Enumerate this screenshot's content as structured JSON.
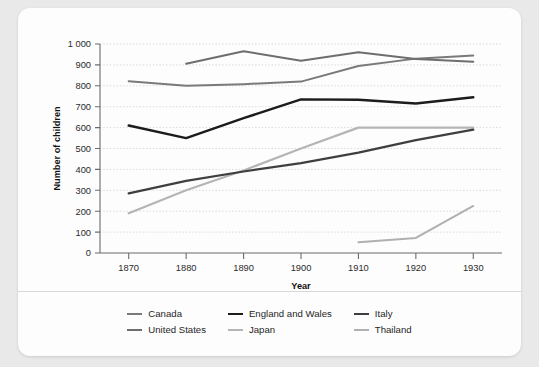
{
  "chart_data": {
    "type": "line",
    "title": "",
    "xlabel": "Year",
    "ylabel": "Number of children",
    "x": [
      1870,
      1880,
      1890,
      1900,
      1910,
      1920,
      1930
    ],
    "xlim": [
      1865,
      1935
    ],
    "ylim": [
      0,
      1000
    ],
    "ytick_labels": [
      "0",
      "100",
      "200",
      "300",
      "400",
      "500",
      "600",
      "700",
      "800",
      "900",
      "1 000"
    ],
    "ytick_values": [
      0,
      100,
      200,
      300,
      400,
      500,
      600,
      700,
      800,
      900,
      1000
    ],
    "xtick_labels": [
      "1870",
      "1880",
      "1890",
      "1900",
      "1910",
      "1920",
      "1930"
    ],
    "grid": "horizontal-dotted",
    "legend_position": "bottom",
    "series": [
      {
        "name": "Canada",
        "color": "#7a7a7a",
        "width": 2.0,
        "x": [
          1870,
          1880,
          1890,
          1900,
          1910,
          1920,
          1930
        ],
        "values": [
          822,
          800,
          808,
          820,
          895,
          930,
          945
        ]
      },
      {
        "name": "United States",
        "color": "#6e6e6e",
        "width": 2.0,
        "x": [
          1880,
          1890,
          1900,
          1910,
          1920,
          1930
        ],
        "values": [
          905,
          965,
          920,
          960,
          928,
          915
        ]
      },
      {
        "name": "England and Wales",
        "color": "#1c1c1c",
        "width": 2.4,
        "x": [
          1870,
          1880,
          1890,
          1900,
          1910,
          1920,
          1930
        ],
        "values": [
          610,
          550,
          645,
          735,
          733,
          715,
          745
        ]
      },
      {
        "name": "Japan",
        "color": "#b5b5b5",
        "width": 2.2,
        "x": [
          1870,
          1880,
          1890,
          1900,
          1910,
          1920,
          1930
        ],
        "values": [
          190,
          300,
          395,
          500,
          600,
          600,
          600
        ]
      },
      {
        "name": "Italy",
        "color": "#3f3f3f",
        "width": 2.2,
        "x": [
          1870,
          1880,
          1890,
          1900,
          1910,
          1920,
          1930
        ],
        "values": [
          285,
          345,
          390,
          430,
          480,
          540,
          590
        ]
      },
      {
        "name": "Thailand",
        "color": "#b0b0b0",
        "width": 2.0,
        "x": [
          1910,
          1920,
          1930
        ],
        "values": [
          52,
          72,
          225
        ]
      }
    ]
  }
}
